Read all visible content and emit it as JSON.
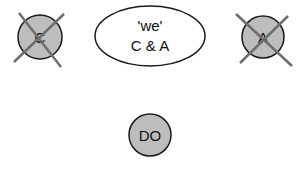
{
  "diagram": {
    "nodes": [
      {
        "id": "C",
        "label": "C",
        "shape": "circle",
        "crossed_out": true,
        "fill": "#bdbdbd"
      },
      {
        "id": "we",
        "label_line1": "'we'",
        "label_line2": "C & A",
        "shape": "ellipse",
        "fill": "#ffffff"
      },
      {
        "id": "A",
        "label": "A",
        "shape": "circle",
        "crossed_out": true,
        "fill": "#bdbdbd"
      },
      {
        "id": "DO",
        "label": "DO",
        "shape": "circle",
        "crossed_out": false,
        "fill": "#bdbdbd"
      }
    ],
    "colors": {
      "stroke": "#1a1a1a",
      "cross": "#6e6e6e",
      "node_fill": "#bdbdbd"
    }
  }
}
